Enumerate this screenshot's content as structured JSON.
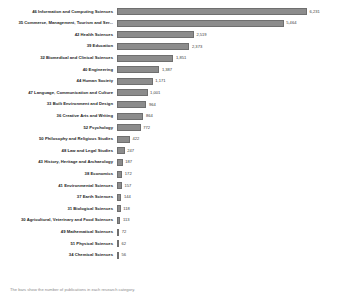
{
  "chart_data": {
    "type": "bar",
    "orientation": "horizontal",
    "title": "",
    "xlabel": "",
    "ylabel": "",
    "grid": false,
    "legend": false,
    "xlim": [
      0,
      6231
    ],
    "categories": [
      "46 Information and Computing Sciences",
      "35 Commerce, Management, Tourism and Ser...",
      "42 Health Sciences",
      "39 Education",
      "32 Biomedical and Clinical Sciences",
      "40 Engineering",
      "44 Human Society",
      "47 Language, Communication and Culture",
      "33 Built Environment and Design",
      "36 Creative Arts and Writing",
      "52 Psychology",
      "50 Philosophy and Religious Studies",
      "48 Law and Legal Studies",
      "43 History, Heritage and Archaeology",
      "38 Economics",
      "41 Environmental Sciences",
      "37 Earth Sciences",
      "31 Biological Sciences",
      "30 Agricultural, Veterinary and Food Sciences",
      "49 Mathematical Sciences",
      "51 Physical Sciences",
      "34 Chemical Sciences"
    ],
    "values": [
      6231,
      5464,
      2519,
      2373,
      1851,
      1387,
      1171,
      1001,
      964,
      864,
      772,
      422,
      247,
      187,
      172,
      157,
      144,
      118,
      113,
      72,
      62,
      56
    ],
    "value_labels": [
      "6,231",
      "5,464",
      "2,519",
      "2,373",
      "1,851",
      "1,387",
      "1,171",
      "1,001",
      "964",
      "864",
      "772",
      "422",
      "247",
      "187",
      "172",
      "157",
      "144",
      "118",
      "113",
      "72",
      "62",
      "56"
    ],
    "bar_color": "#8c8c8c"
  },
  "caption": "The bars show the number of publications in each research category."
}
